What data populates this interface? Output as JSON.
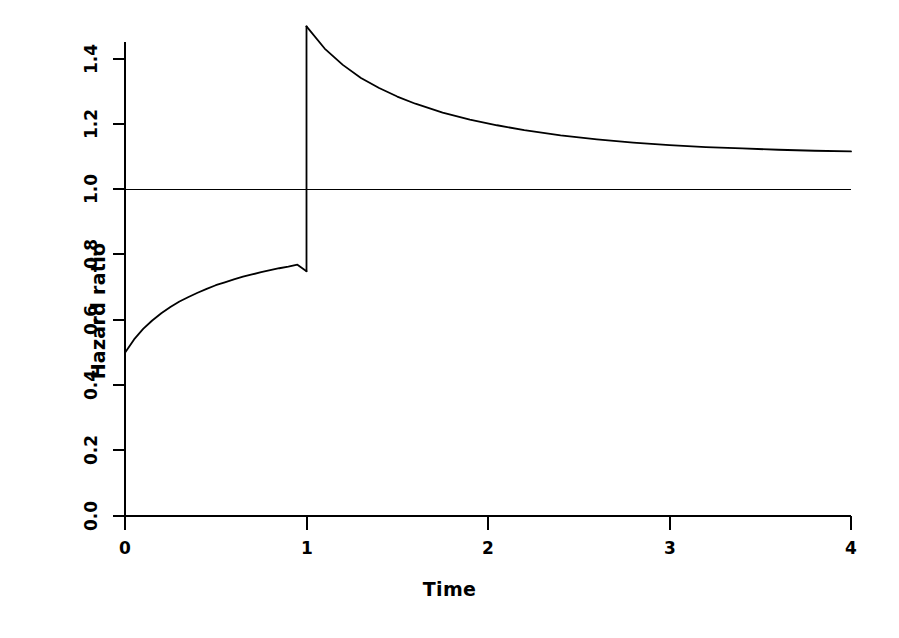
{
  "chart_data": {
    "type": "line",
    "title": "",
    "subtitle": "",
    "xlabel": "Time",
    "ylabel": "Hazard ratio",
    "xlim": [
      0,
      4
    ],
    "ylim": [
      0.0,
      1.5
    ],
    "xticks": [
      0,
      1,
      2,
      3,
      4
    ],
    "xtick_labels": [
      "0",
      "1",
      "2",
      "3",
      "4"
    ],
    "yticks": [
      0.0,
      0.2,
      0.4,
      0.6,
      0.8,
      1.0,
      1.2,
      1.4
    ],
    "ytick_labels": [
      "0.0",
      "0.2",
      "0.4",
      "0.6",
      "0.8",
      "1.0",
      "1.2",
      "1.4"
    ],
    "grid": false,
    "legend": null,
    "legend_position": "none",
    "line_color": "#000000",
    "line_width": 1.6,
    "annotations": [
      {
        "text": "discontinuity at Time = 1",
        "x": 1,
        "y_before": 0.75,
        "y_after": 1.5
      }
    ],
    "series": [
      {
        "name": "reference",
        "type": "line",
        "style": "solid",
        "x": [
          0,
          4
        ],
        "y": [
          1.0,
          1.0
        ]
      },
      {
        "name": "hazard-ratio-segment-1",
        "type": "line",
        "style": "solid",
        "x": [
          0.0,
          0.05,
          0.1,
          0.15,
          0.2,
          0.25,
          0.3,
          0.35,
          0.4,
          0.45,
          0.5,
          0.55,
          0.6,
          0.65,
          0.7,
          0.75,
          0.8,
          0.85,
          0.9,
          0.95,
          1.0
        ],
        "y": [
          0.5,
          0.541,
          0.573,
          0.599,
          0.621,
          0.64,
          0.657,
          0.671,
          0.684,
          0.696,
          0.707,
          0.716,
          0.725,
          0.733,
          0.74,
          0.747,
          0.753,
          0.759,
          0.764,
          0.77,
          0.75
        ]
      },
      {
        "name": "hazard-ratio-jump",
        "type": "line",
        "style": "solid",
        "x": [
          1.0,
          1.0
        ],
        "y": [
          0.75,
          1.5
        ]
      },
      {
        "name": "hazard-ratio-segment-2",
        "type": "line",
        "style": "solid",
        "x": [
          1.0,
          1.1,
          1.2,
          1.3,
          1.4,
          1.5,
          1.6,
          1.75,
          1.9,
          2.05,
          2.2,
          2.4,
          2.6,
          2.8,
          3.0,
          3.2,
          3.4,
          3.6,
          3.8,
          4.0
        ],
        "y": [
          1.5,
          1.432,
          1.382,
          1.342,
          1.311,
          1.285,
          1.263,
          1.236,
          1.214,
          1.197,
          1.182,
          1.166,
          1.154,
          1.144,
          1.136,
          1.13,
          1.126,
          1.122,
          1.119,
          1.117
        ]
      }
    ],
    "curve_endpoints": {
      "start": {
        "x": 0,
        "y": 0.5
      },
      "pre_jump": {
        "x": 1,
        "y": 0.75
      },
      "post_jump": {
        "x": 1,
        "y": 1.5
      },
      "end": {
        "x": 4,
        "y": 1.12
      }
    }
  },
  "axes": {
    "x_axis_name": "Time",
    "y_axis_name": "Hazard ratio"
  }
}
